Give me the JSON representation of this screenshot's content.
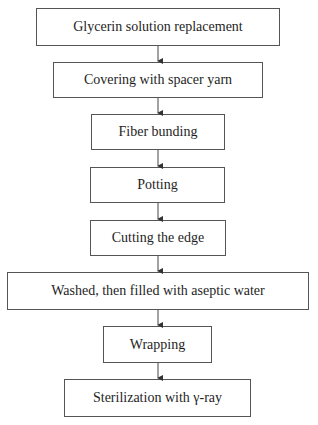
{
  "diagram": {
    "type": "flowchart",
    "direction": "top-to-bottom",
    "steps": [
      {
        "label": "Glycerin solution replacement"
      },
      {
        "label": "Covering with spacer yarn"
      },
      {
        "label": "Fiber bunding"
      },
      {
        "label": "Potting"
      },
      {
        "label": "Cutting the edge"
      },
      {
        "label": "Washed, then filled with aseptic water"
      },
      {
        "label": "Wrapping"
      },
      {
        "label": "Sterilization with γ-ray"
      }
    ],
    "colors": {
      "border": "#555555",
      "text": "#1e1e1e",
      "background": "#ffffff"
    }
  }
}
